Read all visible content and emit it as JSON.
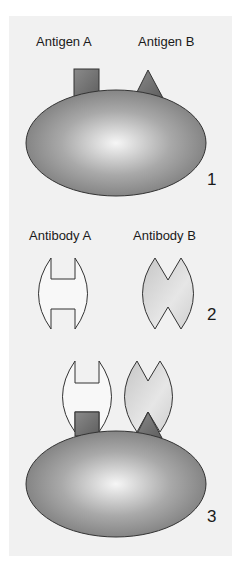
{
  "figure": {
    "step1": {
      "number": "1",
      "antigen_a_label": "Antigen A",
      "antigen_b_label": "Antigen B"
    },
    "step2": {
      "number": "2",
      "antibody_a_label": "Antibody A",
      "antibody_b_label": "Antibody B"
    },
    "step3": {
      "number": "3"
    },
    "colors": {
      "background": "#f1f1f1",
      "cell_dark": "#7a7a7a",
      "cell_light": "#f4f4f4",
      "antigen": "#777777",
      "antibody_a_fill": "#f8f8f8",
      "antibody_b_fill": "#d8d8d8",
      "outline": "#333333"
    }
  }
}
